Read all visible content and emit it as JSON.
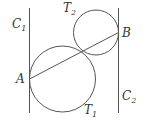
{
  "diagram": {
    "lines": [
      {
        "id": "C1",
        "label": "C",
        "sub": "1",
        "x": 29.5,
        "y1": 8,
        "y2": 113
      },
      {
        "id": "C2",
        "label": "C",
        "sub": "2",
        "x": 118.5,
        "y1": 8,
        "y2": 113
      }
    ],
    "circles": [
      {
        "id": "T1",
        "label": "T",
        "sub": "1",
        "cx": 62.5,
        "cy": 79,
        "r": 33
      },
      {
        "id": "T2",
        "label": "T",
        "sub": "2",
        "cx": 96,
        "cy": 32.5,
        "r": 22.5
      }
    ],
    "points": [
      {
        "id": "A",
        "label": "A",
        "x": 29.5,
        "y": 79
      },
      {
        "id": "B",
        "label": "B",
        "x": 118.5,
        "y": 32.5
      }
    ],
    "segment": {
      "from": "A",
      "to": "B"
    },
    "colors": {
      "stroke": "#555555",
      "text": "#333333"
    }
  }
}
